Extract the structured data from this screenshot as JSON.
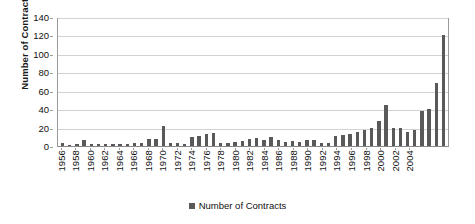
{
  "chart_data": {
    "type": "bar",
    "title": "",
    "subtitle": "",
    "xlabel": "",
    "ylabel": "Number of Contracts",
    "ylim": [
      0,
      140
    ],
    "ytick_step": 20,
    "yticks": [
      0,
      20,
      40,
      60,
      80,
      100,
      120,
      140
    ],
    "grid": true,
    "legend_position": "bottom-center",
    "legend_entries": [
      "Number of Contracts"
    ],
    "series": [
      {
        "name": "Number of Contracts",
        "color": "#595959",
        "values": [
          3,
          1,
          2,
          7,
          2,
          2,
          2,
          2,
          2,
          2,
          3,
          3,
          8,
          8,
          22,
          3,
          3,
          2,
          10,
          11,
          13,
          14,
          3,
          3,
          4,
          5,
          8,
          9,
          6,
          10,
          6,
          4,
          5,
          4,
          6,
          7,
          3,
          3,
          11,
          12,
          13,
          15,
          17,
          20,
          27,
          45,
          20,
          20,
          15,
          17,
          38,
          40,
          68,
          120
        ]
      }
    ],
    "categories": [
      1956,
      1957,
      1958,
      1959,
      1960,
      1961,
      1962,
      1963,
      1964,
      1965,
      1966,
      1967,
      1968,
      1969,
      1970,
      1971,
      1972,
      1973,
      1974,
      1975,
      1976,
      1977,
      1978,
      1979,
      1980,
      1981,
      1982,
      1983,
      1984,
      1985,
      1986,
      1987,
      1988,
      1989,
      1990,
      1991,
      1992,
      1993,
      1994,
      1995,
      1996,
      1997,
      1998,
      1999,
      2000,
      2001,
      2002,
      2003,
      2004,
      2005,
      2006,
      2007,
      2008,
      2009
    ],
    "xtick_labels": [
      "1956",
      "1958",
      "1960",
      "1962",
      "1964",
      "1966",
      "1968",
      "1970",
      "1972",
      "1974",
      "1976",
      "1978",
      "1980",
      "1982",
      "1984",
      "1986",
      "1988",
      "1990",
      "1992",
      "1994",
      "1996",
      "1998",
      "2000",
      "2002",
      "2004"
    ],
    "xtick_indices": [
      0,
      2,
      4,
      6,
      8,
      10,
      12,
      14,
      16,
      18,
      20,
      22,
      24,
      26,
      28,
      30,
      32,
      34,
      36,
      38,
      40,
      42,
      44,
      46,
      48
    ]
  },
  "legend": {
    "label": "Number of Contracts"
  },
  "axes": {
    "y_title": "Number of Contracts"
  },
  "colors": {
    "bar": "#595959",
    "grid": "#d2d2d2",
    "axis": "#9a9a9a",
    "text": "#111111",
    "background": "#ffffff"
  }
}
